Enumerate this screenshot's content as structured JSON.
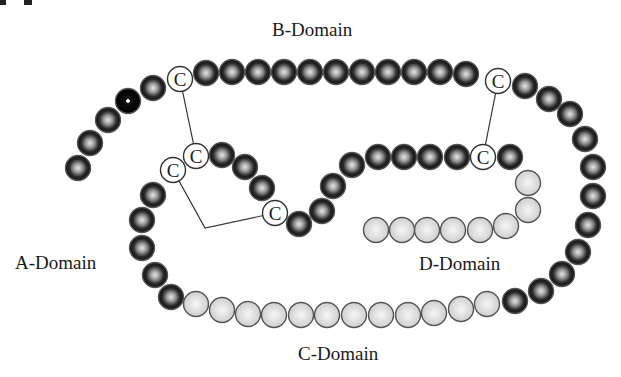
{
  "figure": {
    "labels": {
      "b_domain": "B-Domain",
      "a_domain": "A-Domain",
      "c_domain": "C-Domain",
      "d_domain": "D-Domain",
      "cysteine": "C"
    },
    "colors": {
      "dark_bead_outer": "#1c1c1c",
      "dark_bead_highlight": "#d8d8d8",
      "light_bead_fill": "#d6d6d6",
      "light_bead_highlight": "#f2f2f2",
      "cysteine_fill": "#ffffff",
      "outline": "#555555",
      "bond_line": "#333333"
    },
    "bead_radius": 12.5,
    "beads": [
      {
        "x": 78,
        "y": 168,
        "t": "d"
      },
      {
        "x": 90,
        "y": 143,
        "t": "d"
      },
      {
        "x": 108,
        "y": 120,
        "t": "d"
      },
      {
        "x": 128,
        "y": 101,
        "t": "b"
      },
      {
        "x": 153,
        "y": 88,
        "t": "d"
      },
      {
        "x": 180,
        "y": 79,
        "t": "c"
      },
      {
        "x": 206,
        "y": 73,
        "t": "d"
      },
      {
        "x": 232,
        "y": 72,
        "t": "d"
      },
      {
        "x": 258,
        "y": 72,
        "t": "d"
      },
      {
        "x": 284,
        "y": 72,
        "t": "d"
      },
      {
        "x": 310,
        "y": 72,
        "t": "d"
      },
      {
        "x": 336,
        "y": 72,
        "t": "d"
      },
      {
        "x": 362,
        "y": 72,
        "t": "d"
      },
      {
        "x": 388,
        "y": 72,
        "t": "d"
      },
      {
        "x": 414,
        "y": 72,
        "t": "d"
      },
      {
        "x": 440,
        "y": 72,
        "t": "d"
      },
      {
        "x": 466,
        "y": 74,
        "t": "d"
      },
      {
        "x": 498,
        "y": 81,
        "t": "c"
      },
      {
        "x": 525,
        "y": 86,
        "t": "d"
      },
      {
        "x": 549,
        "y": 99,
        "t": "d"
      },
      {
        "x": 570,
        "y": 114,
        "t": "d"
      },
      {
        "x": 585,
        "y": 139,
        "t": "d"
      },
      {
        "x": 593,
        "y": 167,
        "t": "d"
      },
      {
        "x": 593,
        "y": 196,
        "t": "d"
      },
      {
        "x": 588,
        "y": 225,
        "t": "d"
      },
      {
        "x": 578,
        "y": 252,
        "t": "d"
      },
      {
        "x": 562,
        "y": 274,
        "t": "d"
      },
      {
        "x": 541,
        "y": 291,
        "t": "d"
      },
      {
        "x": 515,
        "y": 301,
        "t": "d"
      },
      {
        "x": 487,
        "y": 304,
        "t": "l"
      },
      {
        "x": 461,
        "y": 309,
        "t": "l"
      },
      {
        "x": 434,
        "y": 313,
        "t": "l"
      },
      {
        "x": 408,
        "y": 315,
        "t": "l"
      },
      {
        "x": 381,
        "y": 315,
        "t": "l"
      },
      {
        "x": 354,
        "y": 315,
        "t": "l"
      },
      {
        "x": 327,
        "y": 315,
        "t": "l"
      },
      {
        "x": 301,
        "y": 315,
        "t": "l"
      },
      {
        "x": 274,
        "y": 315,
        "t": "l"
      },
      {
        "x": 248,
        "y": 314,
        "t": "l"
      },
      {
        "x": 222,
        "y": 310,
        "t": "l"
      },
      {
        "x": 196,
        "y": 304,
        "t": "l"
      },
      {
        "x": 171,
        "y": 297,
        "t": "d"
      },
      {
        "x": 155,
        "y": 275,
        "t": "d"
      },
      {
        "x": 142,
        "y": 248,
        "t": "d"
      },
      {
        "x": 142,
        "y": 220,
        "t": "d"
      },
      {
        "x": 153,
        "y": 195,
        "t": "d"
      },
      {
        "x": 173,
        "y": 170,
        "t": "c"
      },
      {
        "x": 196,
        "y": 156,
        "t": "c"
      },
      {
        "x": 222,
        "y": 155,
        "t": "d"
      },
      {
        "x": 245,
        "y": 167,
        "t": "d"
      },
      {
        "x": 262,
        "y": 188,
        "t": "d"
      },
      {
        "x": 275,
        "y": 213,
        "t": "c"
      },
      {
        "x": 299,
        "y": 224,
        "t": "d"
      },
      {
        "x": 322,
        "y": 211,
        "t": "d"
      },
      {
        "x": 333,
        "y": 186,
        "t": "d"
      },
      {
        "x": 352,
        "y": 165,
        "t": "d"
      },
      {
        "x": 378,
        "y": 157,
        "t": "d"
      },
      {
        "x": 404,
        "y": 157,
        "t": "d"
      },
      {
        "x": 430,
        "y": 157,
        "t": "d"
      },
      {
        "x": 457,
        "y": 157,
        "t": "d"
      },
      {
        "x": 483,
        "y": 157,
        "t": "c"
      },
      {
        "x": 510,
        "y": 157,
        "t": "d"
      },
      {
        "x": 528,
        "y": 183,
        "t": "l"
      },
      {
        "x": 528,
        "y": 210,
        "t": "l"
      },
      {
        "x": 506,
        "y": 226,
        "t": "l"
      },
      {
        "x": 480,
        "y": 230,
        "t": "l"
      },
      {
        "x": 453,
        "y": 230,
        "t": "l"
      },
      {
        "x": 427,
        "y": 230,
        "t": "l"
      },
      {
        "x": 402,
        "y": 230,
        "t": "l"
      },
      {
        "x": 376,
        "y": 230,
        "t": "l"
      }
    ],
    "bonds": [
      {
        "points": "180,79 196,156"
      },
      {
        "points": "173,170 205,228 275,213"
      },
      {
        "points": "498,81 483,157"
      }
    ]
  }
}
